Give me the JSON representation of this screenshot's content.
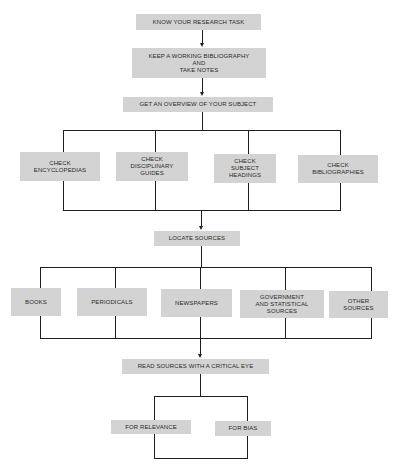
{
  "diagram": {
    "type": "flowchart",
    "colors": {
      "box_fill": "#d3d3d3",
      "line": "#1e1e1e",
      "text": "#2a2a2a"
    },
    "steps": [
      {
        "id": "know",
        "label": "KNOW YOUR RESEARCH TASK"
      },
      {
        "id": "keep",
        "label": "KEEP A WORKING BIBLIOGRAPHY\nAND\nTAKE NOTES"
      },
      {
        "id": "overview",
        "label": "GET AN OVERVIEW OF YOUR SUBJECT",
        "branches": [
          {
            "label": "CHECK\nENCYCLOPEDIAS"
          },
          {
            "label": "CHECK\nDISCIPLINARY\nGUIDES"
          },
          {
            "label": "CHECK\nSUBJECT\nHEADINGS"
          },
          {
            "label": "CHECK\nBIBLIOGRAPHIES"
          }
        ]
      },
      {
        "id": "locate",
        "label": "LOCATE SOURCES",
        "branches": [
          {
            "label": "BOOKS"
          },
          {
            "label": "PERIODICALS"
          },
          {
            "label": "NEWSPAPERS"
          },
          {
            "label": "GOVERNMENT\nAND STATISTICAL\nSOURCES"
          },
          {
            "label": "OTHER\nSOURCES"
          }
        ]
      },
      {
        "id": "read",
        "label": "READ SOURCES WITH A CRITICAL EYE",
        "branches": [
          {
            "label": "FOR RELEVANCE"
          },
          {
            "label": "FOR BIAS"
          }
        ]
      }
    ]
  }
}
